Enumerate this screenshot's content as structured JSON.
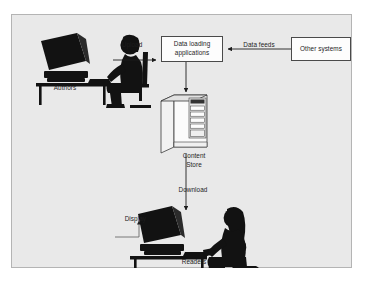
{
  "figure": {
    "ghost_line": "",
    "background_color": "#e9e9e9",
    "frame_border_color": "#b4b4b4",
    "ink_color": "#1d1d1d"
  },
  "nodes": [
    {
      "id": "data-loading-applications",
      "kind": "process-box",
      "label_line1": "Data loading",
      "label_line2": "applications"
    },
    {
      "id": "other-systems",
      "kind": "process-box",
      "label_line1": "Other systems"
    },
    {
      "id": "authors",
      "kind": "actor-silhouette",
      "label": "Authors"
    },
    {
      "id": "content-store",
      "kind": "server-tower",
      "label_line1": "Content",
      "label_line2": "Store"
    },
    {
      "id": "readers",
      "kind": "actor-silhouette",
      "label": "Readers"
    }
  ],
  "edges": [
    {
      "id": "authors-to-loading",
      "from": "authors",
      "to": "data-loading-applications",
      "label": "Upload",
      "direction": "right"
    },
    {
      "id": "other-to-loading",
      "from": "other-systems",
      "to": "data-loading-applications",
      "label": "Data feeds",
      "direction": "left"
    },
    {
      "id": "loading-to-store",
      "from": "data-loading-applications",
      "to": "content-store",
      "label": "",
      "direction": "down"
    },
    {
      "id": "store-to-readers",
      "from": "content-store",
      "to": "readers",
      "label": "Download",
      "direction": "down"
    },
    {
      "id": "display-callout",
      "from": "display-label",
      "to": "reader-monitor",
      "label": "Display",
      "direction": "right"
    }
  ]
}
